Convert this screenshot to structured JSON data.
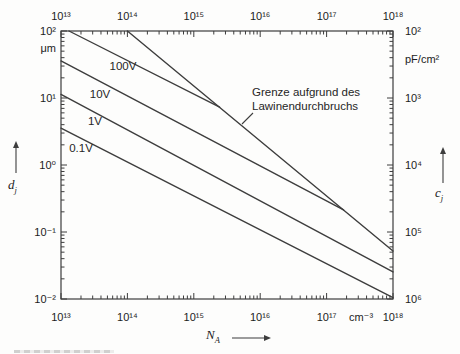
{
  "figure": {
    "background": "#fdfdfc",
    "line_color": "#3d3d3d",
    "text_color": "#1c1c1c"
  },
  "chart_data": {
    "type": "line",
    "title": "",
    "grid": false,
    "x_axis": {
      "symbol": "N",
      "symbol_sub": "A",
      "unit": "cm⁻³",
      "scale": "log",
      "range_exp": [
        13,
        18
      ],
      "tick_labels": [
        "10¹³",
        "10¹⁴",
        "10¹⁵",
        "10¹⁶",
        "10¹⁷",
        "10¹⁸"
      ]
    },
    "y_left_axis": {
      "symbol": "d",
      "symbol_sub": "j",
      "unit": "μm",
      "scale": "log",
      "range_exp": [
        2,
        -2
      ],
      "tick_labels_top_to_bottom": [
        "10²",
        "10¹",
        "10⁰",
        "10⁻¹",
        "10⁻²"
      ]
    },
    "y_right_axis": {
      "symbol": "c",
      "symbol_sub": "j",
      "unit": "pF/cm²",
      "scale": "log",
      "range_exp": [
        2,
        6
      ],
      "tick_labels_top_to_bottom": [
        "10²",
        "10³",
        "10⁴",
        "10⁵",
        "10⁶"
      ]
    },
    "series": [
      {
        "name": "curve-0.1V",
        "label": "0.1V",
        "points": [
          [
            10000000000000.0,
            3.55
          ],
          [
            1e+18,
            0.0105
          ]
        ],
        "label_px": {
          "x": 81,
          "y": 148
        }
      },
      {
        "name": "curve-1V",
        "label": "1V",
        "points": [
          [
            10000000000000.0,
            11.3
          ],
          [
            1e+18,
            0.0253
          ]
        ],
        "label_px": {
          "x": 95,
          "y": 121
        }
      },
      {
        "name": "curve-10V",
        "label": "10V",
        "points": [
          [
            10000000000000.0,
            35.7
          ],
          [
            1.8e+17,
            0.214
          ]
        ],
        "label_px": {
          "x": 100,
          "y": 94
        }
      },
      {
        "name": "curve-100V",
        "label": "100V",
        "points": [
          [
            13200000000000.0,
            100
          ],
          [
            2450000000000000.0,
            7.3
          ]
        ],
        "label_px": {
          "x": 123,
          "y": 66
        }
      },
      {
        "name": "curve-avalanche-limit",
        "label": "",
        "points": [
          [
            100000000000000.0,
            100
          ],
          [
            1e+18,
            0.052
          ]
        ]
      }
    ],
    "annotation": {
      "lines": [
        "Grenze aufgrund des",
        "Lawinendurchbruchs"
      ],
      "text_px": {
        "x": 252,
        "y": 86
      },
      "leader_px": {
        "x1": 242,
        "y1": 124,
        "x2": 253,
        "y2": 113
      }
    },
    "layout": {
      "plot_px": {
        "left": 61,
        "right": 393,
        "top": 31,
        "bottom": 299
      },
      "tick_len_major": 6,
      "tick_len_minor": 3.5,
      "arrows_px": {
        "left_axis": {
          "x": 16,
          "tip_y": 141,
          "tail_y": 173
        },
        "right_axis": {
          "x": 443,
          "tip_y": 147,
          "tail_y": 183
        },
        "x_axis": {
          "y": 338,
          "tail_x": 232,
          "tip_x": 271
        }
      }
    }
  }
}
